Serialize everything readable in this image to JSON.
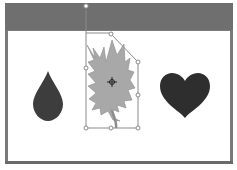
{
  "window": {
    "topbar_color": "#6f6f6f",
    "frame_color": "#7a7a7a",
    "canvas_color": "#ffffff"
  },
  "canvas": {
    "shapes": [
      {
        "name": "droplet",
        "icon": "droplet-shape",
        "fill": "#3d3d3d",
        "selected": false
      },
      {
        "name": "maple-leaf",
        "icon": "leaf-shape",
        "fill": "#a8a8a8",
        "selected": true,
        "rotation_deg": -15
      },
      {
        "name": "heart",
        "icon": "heart-shape",
        "fill": "#2e2e2e",
        "selected": false
      }
    ],
    "selection": {
      "handles": 8,
      "rotation_handle": true,
      "center_pivot": true,
      "handle_color": "#ffffff",
      "outline_color": "#8a8a8a"
    }
  }
}
